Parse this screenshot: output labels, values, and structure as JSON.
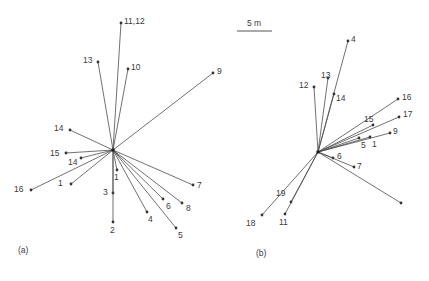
{
  "figure": {
    "type": "vector-star-diagram",
    "background_color": "#ffffff",
    "line_color": "#4c4c4c",
    "label_color": "#3a3a3a",
    "scale_bar": {
      "label": "5 m",
      "x1": 237,
      "x2": 272,
      "y": 31,
      "text_x": 254,
      "text_y": 26
    },
    "panels": [
      {
        "id": "a",
        "caption": "(a)",
        "caption_x": 18,
        "caption_y": 253,
        "hub": {
          "x": 113,
          "y": 150
        },
        "vectors": [
          {
            "label": "11,12",
            "tip_x": 121,
            "tip_y": 23,
            "label_x": 124,
            "label_y": 24
          },
          {
            "label": "13",
            "tip_x": 98,
            "tip_y": 62,
            "label_x": 83,
            "label_y": 63
          },
          {
            "label": "10",
            "tip_x": 128,
            "tip_y": 69,
            "label_x": 131,
            "label_y": 70
          },
          {
            "label": "9",
            "tip_x": 213,
            "tip_y": 73,
            "label_x": 217,
            "label_y": 74
          },
          {
            "label": "14",
            "tip_x": 70,
            "tip_y": 130,
            "label_x": 54,
            "label_y": 131
          },
          {
            "label": "15",
            "tip_x": 66,
            "tip_y": 153,
            "label_x": 50,
            "label_y": 156
          },
          {
            "label": "14",
            "tip_x": 81,
            "tip_y": 158,
            "label_x": 68,
            "label_y": 165
          },
          {
            "label": "16",
            "tip_x": 31,
            "tip_y": 190,
            "label_x": 14,
            "label_y": 192
          },
          {
            "label": "1",
            "tip_x": 71,
            "tip_y": 184,
            "label_x": 58,
            "label_y": 186
          },
          {
            "label": "1",
            "tip_x": 117,
            "tip_y": 170,
            "label_x": 114,
            "label_y": 180
          },
          {
            "label": "3",
            "tip_x": 113,
            "tip_y": 193,
            "label_x": 103,
            "label_y": 195
          },
          {
            "label": "2",
            "tip_x": 113,
            "tip_y": 222,
            "label_x": 110,
            "label_y": 233
          },
          {
            "label": "4",
            "tip_x": 147,
            "tip_y": 212,
            "label_x": 148,
            "label_y": 222
          },
          {
            "label": "5",
            "tip_x": 176,
            "tip_y": 228,
            "label_x": 178,
            "label_y": 238
          },
          {
            "label": "6",
            "tip_x": 163,
            "tip_y": 199,
            "label_x": 166,
            "label_y": 209
          },
          {
            "label": "8",
            "tip_x": 182,
            "tip_y": 203,
            "label_x": 186,
            "label_y": 211
          },
          {
            "label": "7",
            "tip_x": 193,
            "tip_y": 185,
            "label_x": 197,
            "label_y": 188
          }
        ]
      },
      {
        "id": "b",
        "caption": "(b)",
        "caption_x": 256,
        "caption_y": 256,
        "hub": {
          "x": 318,
          "y": 152
        },
        "vectors": [
          {
            "label": "4",
            "tip_x": 348,
            "tip_y": 41,
            "label_x": 351,
            "label_y": 42
          },
          {
            "label": "13",
            "tip_x": 328,
            "tip_y": 78,
            "label_x": 321,
            "label_y": 78
          },
          {
            "label": "12",
            "tip_x": 314,
            "tip_y": 87,
            "label_x": 299,
            "label_y": 88
          },
          {
            "label": "14",
            "tip_x": 334,
            "tip_y": 94,
            "label_x": 336,
            "label_y": 101
          },
          {
            "label": "16",
            "tip_x": 398,
            "tip_y": 99,
            "label_x": 402,
            "label_y": 100
          },
          {
            "label": "17",
            "tip_x": 399,
            "tip_y": 117,
            "label_x": 403,
            "label_y": 117
          },
          {
            "label": "15",
            "tip_x": 373,
            "tip_y": 125,
            "label_x": 364,
            "label_y": 122
          },
          {
            "label": "9",
            "tip_x": 390,
            "tip_y": 133,
            "label_x": 393,
            "label_y": 134
          },
          {
            "label": "5",
            "tip_x": 359,
            "tip_y": 138,
            "label_x": 361,
            "label_y": 148
          },
          {
            "label": "1",
            "tip_x": 370,
            "tip_y": 137,
            "label_x": 372,
            "label_y": 147
          },
          {
            "label": "6",
            "tip_x": 333,
            "tip_y": 158,
            "label_x": 337,
            "label_y": 159
          },
          {
            "label": "7",
            "tip_x": 354,
            "tip_y": 167,
            "label_x": 357,
            "label_y": 169
          },
          {
            "label": "",
            "tip_x": 401,
            "tip_y": 203,
            "label_x": 0,
            "label_y": 0
          },
          {
            "label": "19",
            "tip_x": 291,
            "tip_y": 202,
            "label_x": 276,
            "label_y": 196
          },
          {
            "label": "11",
            "tip_x": 285,
            "tip_y": 214,
            "label_x": 279,
            "label_y": 225
          },
          {
            "label": "18",
            "tip_x": 262,
            "tip_y": 215,
            "label_x": 246,
            "label_y": 226
          }
        ]
      }
    ]
  }
}
